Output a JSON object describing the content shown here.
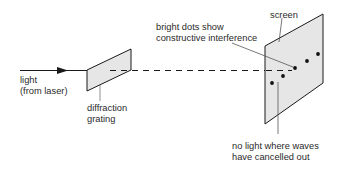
{
  "diagram": {
    "labels": {
      "light_line1": "light",
      "light_line2": "(from laser)",
      "grating_line1": "diffraction",
      "grating_line2": "grating",
      "screen": "screen",
      "bright_line1": "bright dots show",
      "bright_line2": "constructive interference",
      "dark_line1": "no light where waves",
      "dark_line2": "have cancelled out"
    },
    "colors": {
      "stroke": "#1a1a1a",
      "panel_fill": "#e6e6e6",
      "leader": "#555555",
      "text": "#2a2a2a"
    },
    "dots_count": 5
  }
}
